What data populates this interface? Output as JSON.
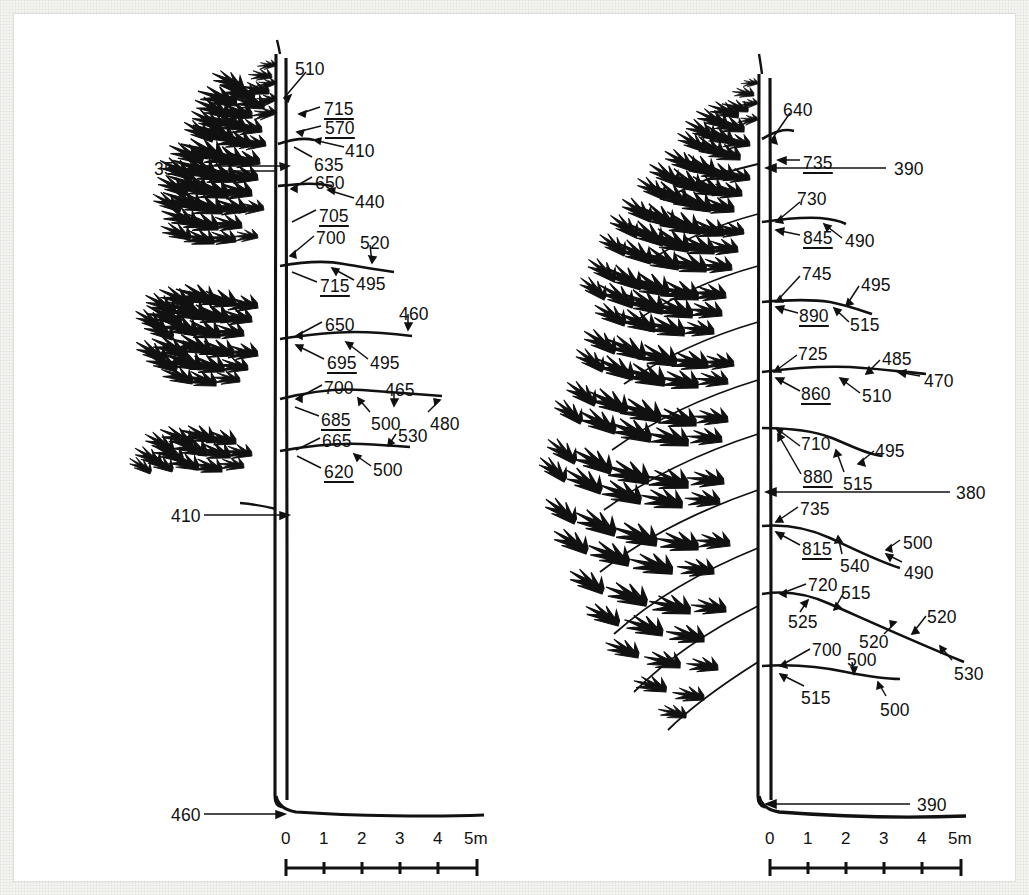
{
  "figure": {
    "type": "scientific-diagram",
    "panel_count": 2,
    "units_note": "5m",
    "ink_color": "#111111",
    "paper_color": "#ffffff"
  },
  "scale_bars": {
    "ticks": [
      "0",
      "1",
      "2",
      "3",
      "4"
    ],
    "end_label": "5m"
  },
  "left_tree": {
    "name": "left-tree-panel",
    "labels": [
      {
        "id": "l-510",
        "text": "510",
        "underline": false,
        "x": 281,
        "y": 47
      },
      {
        "id": "l-715a",
        "text": "715",
        "underline": true,
        "x": 310,
        "y": 87
      },
      {
        "id": "l-570",
        "text": "570",
        "underline": true,
        "x": 311,
        "y": 106
      },
      {
        "id": "l-410a",
        "text": "410",
        "underline": false,
        "x": 331,
        "y": 129
      },
      {
        "id": "l-635",
        "text": "635",
        "underline": false,
        "x": 300,
        "y": 143
      },
      {
        "id": "l-350",
        "text": "350",
        "underline": false,
        "x": 140,
        "y": 147
      },
      {
        "id": "l-650a",
        "text": "650",
        "underline": false,
        "x": 301,
        "y": 161
      },
      {
        "id": "l-440",
        "text": "440",
        "underline": false,
        "x": 341,
        "y": 180
      },
      {
        "id": "l-705",
        "text": "705",
        "underline": true,
        "x": 305,
        "y": 194
      },
      {
        "id": "l-700a",
        "text": "700",
        "underline": false,
        "x": 302,
        "y": 216
      },
      {
        "id": "l-520",
        "text": "520",
        "underline": false,
        "x": 346,
        "y": 221
      },
      {
        "id": "l-715b",
        "text": "715",
        "underline": true,
        "x": 306,
        "y": 264
      },
      {
        "id": "l-495a",
        "text": "495",
        "underline": false,
        "x": 342,
        "y": 262
      },
      {
        "id": "l-650b",
        "text": "650",
        "underline": false,
        "x": 311,
        "y": 303
      },
      {
        "id": "l-460a",
        "text": "460",
        "underline": false,
        "x": 385,
        "y": 292
      },
      {
        "id": "l-695",
        "text": "695",
        "underline": true,
        "x": 313,
        "y": 341
      },
      {
        "id": "l-495b",
        "text": "495",
        "underline": false,
        "x": 356,
        "y": 341
      },
      {
        "id": "l-700b",
        "text": "700",
        "underline": false,
        "x": 310,
        "y": 366
      },
      {
        "id": "l-465",
        "text": "465",
        "underline": false,
        "x": 371,
        "y": 368
      },
      {
        "id": "l-685",
        "text": "685",
        "underline": true,
        "x": 307,
        "y": 398
      },
      {
        "id": "l-500a",
        "text": "500",
        "underline": false,
        "x": 357,
        "y": 402
      },
      {
        "id": "l-480",
        "text": "480",
        "underline": false,
        "x": 416,
        "y": 402
      },
      {
        "id": "l-665",
        "text": "665",
        "underline": false,
        "x": 308,
        "y": 419
      },
      {
        "id": "l-530",
        "text": "530",
        "underline": false,
        "x": 384,
        "y": 414
      },
      {
        "id": "l-620",
        "text": "620",
        "underline": true,
        "x": 310,
        "y": 450
      },
      {
        "id": "l-500b",
        "text": "500",
        "underline": false,
        "x": 359,
        "y": 448
      },
      {
        "id": "l-410b",
        "text": "410",
        "underline": false,
        "x": 157,
        "y": 494
      },
      {
        "id": "l-460b",
        "text": "460",
        "underline": false,
        "x": 157,
        "y": 793
      }
    ]
  },
  "right_tree": {
    "name": "right-tree-panel",
    "labels": [
      {
        "id": "r-640",
        "text": "640",
        "underline": false,
        "x": 769,
        "y": 88
      },
      {
        "id": "r-735a",
        "text": "735",
        "underline": true,
        "x": 789,
        "y": 141
      },
      {
        "id": "r-390a",
        "text": "390",
        "underline": false,
        "x": 880,
        "y": 147
      },
      {
        "id": "r-730",
        "text": "730",
        "underline": false,
        "x": 783,
        "y": 177
      },
      {
        "id": "r-845",
        "text": "845",
        "underline": true,
        "x": 789,
        "y": 216
      },
      {
        "id": "r-490a",
        "text": "490",
        "underline": false,
        "x": 831,
        "y": 219
      },
      {
        "id": "r-745",
        "text": "745",
        "underline": false,
        "x": 788,
        "y": 252
      },
      {
        "id": "r-495a",
        "text": "495",
        "underline": false,
        "x": 847,
        "y": 263
      },
      {
        "id": "r-890",
        "text": "890",
        "underline": true,
        "x": 785,
        "y": 294
      },
      {
        "id": "r-515a",
        "text": "515",
        "underline": false,
        "x": 836,
        "y": 303
      },
      {
        "id": "r-725",
        "text": "725",
        "underline": false,
        "x": 784,
        "y": 332
      },
      {
        "id": "r-485",
        "text": "485",
        "underline": false,
        "x": 868,
        "y": 337
      },
      {
        "id": "r-470",
        "text": "470",
        "underline": false,
        "x": 910,
        "y": 359
      },
      {
        "id": "r-860",
        "text": "860",
        "underline": true,
        "x": 787,
        "y": 372
      },
      {
        "id": "r-510",
        "text": "510",
        "underline": false,
        "x": 848,
        "y": 374
      },
      {
        "id": "r-710",
        "text": "710",
        "underline": false,
        "x": 787,
        "y": 422
      },
      {
        "id": "r-495b",
        "text": "495",
        "underline": false,
        "x": 861,
        "y": 429
      },
      {
        "id": "r-880",
        "text": "880",
        "underline": true,
        "x": 789,
        "y": 455
      },
      {
        "id": "r-515b",
        "text": "515",
        "underline": false,
        "x": 829,
        "y": 462
      },
      {
        "id": "r-380",
        "text": "380",
        "underline": false,
        "x": 942,
        "y": 471
      },
      {
        "id": "r-735b",
        "text": "735",
        "underline": false,
        "x": 786,
        "y": 487
      },
      {
        "id": "r-815",
        "text": "815",
        "underline": true,
        "x": 788,
        "y": 527
      },
      {
        "id": "r-500a",
        "text": "500",
        "underline": false,
        "x": 889,
        "y": 521
      },
      {
        "id": "r-540",
        "text": "540",
        "underline": false,
        "x": 826,
        "y": 544
      },
      {
        "id": "r-490b",
        "text": "490",
        "underline": false,
        "x": 890,
        "y": 551
      },
      {
        "id": "r-720",
        "text": "720",
        "underline": false,
        "x": 794,
        "y": 563
      },
      {
        "id": "r-515c",
        "text": "515",
        "underline": false,
        "x": 827,
        "y": 571
      },
      {
        "id": "r-525",
        "text": "525",
        "underline": false,
        "x": 774,
        "y": 600
      },
      {
        "id": "r-520a",
        "text": "520",
        "underline": false,
        "x": 913,
        "y": 595
      },
      {
        "id": "r-520b",
        "text": "520",
        "underline": false,
        "x": 845,
        "y": 620
      },
      {
        "id": "r-700",
        "text": "700",
        "underline": false,
        "x": 798,
        "y": 628
      },
      {
        "id": "r-500b",
        "text": "500",
        "underline": false,
        "x": 833,
        "y": 638
      },
      {
        "id": "r-530",
        "text": "530",
        "underline": false,
        "x": 940,
        "y": 652
      },
      {
        "id": "r-515d",
        "text": "515",
        "underline": false,
        "x": 787,
        "y": 676
      },
      {
        "id": "r-500c",
        "text": "500",
        "underline": false,
        "x": 866,
        "y": 688
      },
      {
        "id": "r-390b",
        "text": "390",
        "underline": false,
        "x": 903,
        "y": 783
      }
    ]
  }
}
